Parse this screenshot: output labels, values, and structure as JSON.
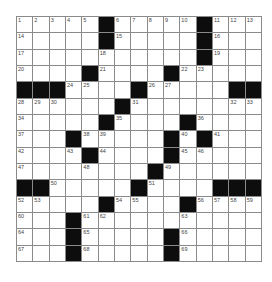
{
  "puzzle": {
    "rows": 15,
    "cols": 15,
    "colors": {
      "block": "#0d0d0d",
      "cell": "#ffffff",
      "grid_line": "#8a8a8a",
      "number": "#444444"
    },
    "layout": [
      ".....#.....#...",
      ".....#.....#...",
      "...........#...",
      "....#....#.....",
      "###....#.....##",
      "......#........",
      ".....#....#....",
      "...#.....#.#...",
      "....#....#.....",
      "........#......",
      "##.....#....###",
      ".....#....#....",
      "...#...........",
      "...#.....#.....",
      "...#.....#....."
    ],
    "numbers": [
      {
        "r": 0,
        "c": 0,
        "n": "1"
      },
      {
        "r": 0,
        "c": 1,
        "n": "2"
      },
      {
        "r": 0,
        "c": 2,
        "n": "3"
      },
      {
        "r": 0,
        "c": 3,
        "n": "4"
      },
      {
        "r": 0,
        "c": 4,
        "n": "5"
      },
      {
        "r": 0,
        "c": 6,
        "n": "6"
      },
      {
        "r": 0,
        "c": 7,
        "n": "7"
      },
      {
        "r": 0,
        "c": 8,
        "n": "8"
      },
      {
        "r": 0,
        "c": 9,
        "n": "9"
      },
      {
        "r": 0,
        "c": 10,
        "n": "10"
      },
      {
        "r": 0,
        "c": 12,
        "n": "11"
      },
      {
        "r": 0,
        "c": 13,
        "n": "12"
      },
      {
        "r": 0,
        "c": 14,
        "n": "13"
      },
      {
        "r": 1,
        "c": 0,
        "n": "14"
      },
      {
        "r": 1,
        "c": 6,
        "n": "15"
      },
      {
        "r": 1,
        "c": 12,
        "n": "16"
      },
      {
        "r": 2,
        "c": 0,
        "n": "17"
      },
      {
        "r": 2,
        "c": 5,
        "n": "18"
      },
      {
        "r": 2,
        "c": 12,
        "n": "19"
      },
      {
        "r": 3,
        "c": 0,
        "n": "20"
      },
      {
        "r": 3,
        "c": 5,
        "n": "21"
      },
      {
        "r": 3,
        "c": 10,
        "n": "22"
      },
      {
        "r": 3,
        "c": 11,
        "n": "23"
      },
      {
        "r": 4,
        "c": 3,
        "n": "24"
      },
      {
        "r": 4,
        "c": 4,
        "n": "25"
      },
      {
        "r": 4,
        "c": 8,
        "n": "26"
      },
      {
        "r": 4,
        "c": 9,
        "n": "27"
      },
      {
        "r": 5,
        "c": 0,
        "n": "28"
      },
      {
        "r": 5,
        "c": 1,
        "n": "29"
      },
      {
        "r": 5,
        "c": 2,
        "n": "30"
      },
      {
        "r": 5,
        "c": 7,
        "n": "31"
      },
      {
        "r": 5,
        "c": 13,
        "n": "32"
      },
      {
        "r": 5,
        "c": 14,
        "n": "33"
      },
      {
        "r": 6,
        "c": 0,
        "n": "34"
      },
      {
        "r": 6,
        "c": 6,
        "n": "35"
      },
      {
        "r": 6,
        "c": 11,
        "n": "36"
      },
      {
        "r": 7,
        "c": 0,
        "n": "37"
      },
      {
        "r": 7,
        "c": 4,
        "n": "38"
      },
      {
        "r": 7,
        "c": 5,
        "n": "39"
      },
      {
        "r": 7,
        "c": 10,
        "n": "40"
      },
      {
        "r": 7,
        "c": 12,
        "n": "41"
      },
      {
        "r": 8,
        "c": 0,
        "n": "42"
      },
      {
        "r": 8,
        "c": 3,
        "n": "43"
      },
      {
        "r": 8,
        "c": 5,
        "n": "44"
      },
      {
        "r": 8,
        "c": 10,
        "n": "45"
      },
      {
        "r": 8,
        "c": 11,
        "n": "46"
      },
      {
        "r": 9,
        "c": 0,
        "n": "47"
      },
      {
        "r": 9,
        "c": 4,
        "n": "48"
      },
      {
        "r": 9,
        "c": 9,
        "n": "49"
      },
      {
        "r": 10,
        "c": 2,
        "n": "50"
      },
      {
        "r": 10,
        "c": 8,
        "n": "51"
      },
      {
        "r": 11,
        "c": 0,
        "n": "52"
      },
      {
        "r": 11,
        "c": 1,
        "n": "53"
      },
      {
        "r": 11,
        "c": 6,
        "n": "54"
      },
      {
        "r": 11,
        "c": 7,
        "n": "55"
      },
      {
        "r": 11,
        "c": 11,
        "n": "56"
      },
      {
        "r": 11,
        "c": 12,
        "n": "57"
      },
      {
        "r": 11,
        "c": 13,
        "n": "58"
      },
      {
        "r": 11,
        "c": 14,
        "n": "59"
      },
      {
        "r": 12,
        "c": 0,
        "n": "60"
      },
      {
        "r": 12,
        "c": 4,
        "n": "61"
      },
      {
        "r": 12,
        "c": 5,
        "n": "62"
      },
      {
        "r": 12,
        "c": 10,
        "n": "63"
      },
      {
        "r": 13,
        "c": 0,
        "n": "64"
      },
      {
        "r": 13,
        "c": 4,
        "n": "65"
      },
      {
        "r": 13,
        "c": 10,
        "n": "66"
      },
      {
        "r": 14,
        "c": 0,
        "n": "67"
      },
      {
        "r": 14,
        "c": 4,
        "n": "68"
      },
      {
        "r": 14,
        "c": 10,
        "n": "69"
      }
    ]
  }
}
